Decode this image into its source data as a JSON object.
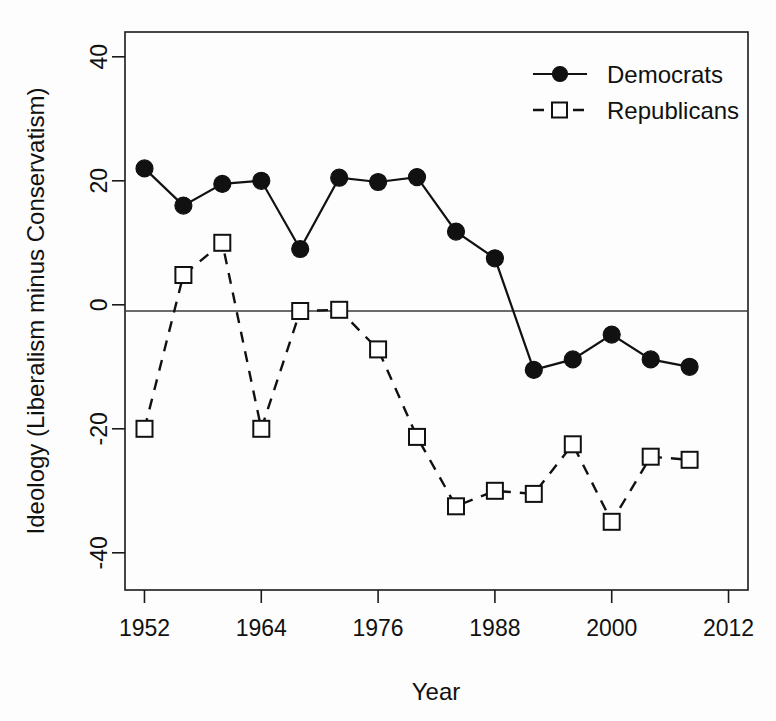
{
  "chart_data": {
    "type": "line",
    "title": "",
    "xlabel": "Year",
    "ylabel": "Ideology (Liberalism minus Conservatism)",
    "xlim": [
      1950,
      2014
    ],
    "ylim": [
      -46,
      44
    ],
    "xticks": [
      1952,
      1964,
      1976,
      1988,
      2000,
      2012
    ],
    "yticks": [
      40,
      20,
      0,
      -20,
      -40
    ],
    "grid": false,
    "zero_reference_line": true,
    "legend_position": "top-right",
    "x": [
      1952,
      1956,
      1960,
      1964,
      1968,
      1972,
      1976,
      1980,
      1984,
      1988,
      1992,
      1996,
      2000,
      2004,
      2008
    ],
    "series": [
      {
        "name": "Democrats",
        "marker": "filled-circle",
        "linestyle": "solid",
        "color": "#111111",
        "values": [
          22,
          16,
          19.5,
          20,
          9,
          20.5,
          19.8,
          20.6,
          11.8,
          7.5,
          -10.5,
          -8.8,
          -4.8,
          -8.8,
          -10
        ]
      },
      {
        "name": "Republicans",
        "marker": "open-square",
        "linestyle": "dashed",
        "color": "#111111",
        "values": [
          -20,
          4.8,
          10,
          -20,
          -1,
          -0.8,
          -7.2,
          -21.3,
          -32.5,
          -30,
          -30.5,
          -22.5,
          -35,
          -24.5,
          -25
        ]
      }
    ]
  },
  "legend": {
    "items": [
      {
        "label": "Democrats"
      },
      {
        "label": "Republicans"
      }
    ]
  },
  "axis": {
    "y_title": "Ideology (Liberalism minus Conservatism)",
    "x_title": "Year",
    "y_tick_labels": [
      "40",
      "20",
      "0",
      "-20",
      "-40"
    ],
    "x_tick_labels": [
      "1952",
      "1964",
      "1976",
      "1988",
      "2000",
      "2012"
    ]
  }
}
